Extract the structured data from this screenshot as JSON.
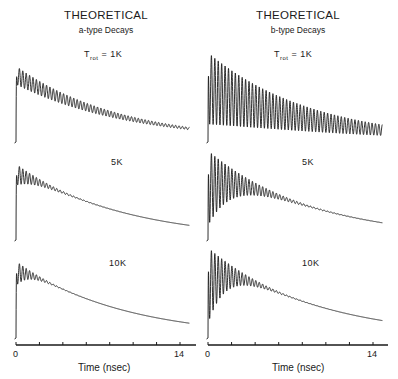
{
  "columns": [
    {
      "title": "THEORETICAL",
      "subtitle": "a-type Decays",
      "x_axis": {
        "label": "Time (nsec)",
        "tick_start": "0",
        "tick_end": "14"
      }
    },
    {
      "title": "THEORETICAL",
      "subtitle": "b-type Decays",
      "x_axis": {
        "label": "Time (nsec)",
        "tick_start": "0",
        "tick_end": "14"
      }
    }
  ],
  "panel_labels": {
    "row1": {
      "prefix": "T",
      "sub": "rot",
      "suffix": " = 1K"
    },
    "row2": "5K",
    "row3": "10K"
  },
  "chart_data": [
    {
      "type": "line",
      "title": "THEORETICAL a-type Decays",
      "xlabel": "Time (nsec)",
      "ylabel": "",
      "xlim": [
        0,
        14.5
      ],
      "x_ticks": [
        0,
        2,
        4,
        6,
        8,
        10,
        12,
        14
      ],
      "x_tick_labels": [
        "0",
        "14"
      ],
      "grid": false,
      "series": [
        {
          "name": "T_rot = 1K",
          "decay_tau_ns": 9.0,
          "beat_period_ns": 0.29,
          "modulation_depth": 0.12,
          "modulation_damping_ns": 40,
          "peak": 1.0
        },
        {
          "name": "5K",
          "decay_tau_ns": 9.0,
          "beat_period_ns": 0.29,
          "modulation_depth": 0.14,
          "modulation_damping_ns": 2.2,
          "peak": 1.0
        },
        {
          "name": "10K",
          "decay_tau_ns": 9.0,
          "beat_period_ns": 0.29,
          "modulation_depth": 0.16,
          "modulation_damping_ns": 1.3,
          "peak": 1.0
        }
      ]
    },
    {
      "type": "line",
      "title": "THEORETICAL b-type Decays",
      "xlabel": "Time (nsec)",
      "ylabel": "",
      "xlim": [
        0,
        14.5
      ],
      "x_ticks": [
        0,
        2,
        4,
        6,
        8,
        10,
        12,
        14
      ],
      "x_tick_labels": [
        "0",
        "14"
      ],
      "grid": false,
      "series": [
        {
          "name": "T_rot = 1K",
          "decay_tau_ns": 9.0,
          "beat_period_ns": 0.29,
          "modulation_depth": 0.4,
          "modulation_damping_ns": 60,
          "peak": 1.0
        },
        {
          "name": "5K",
          "decay_tau_ns": 9.0,
          "beat_period_ns": 0.29,
          "modulation_depth": 0.42,
          "modulation_damping_ns": 3.0,
          "peak": 1.0
        },
        {
          "name": "10K",
          "decay_tau_ns": 9.0,
          "beat_period_ns": 0.29,
          "modulation_depth": 0.42,
          "modulation_damping_ns": 2.0,
          "peak": 1.0
        }
      ]
    }
  ],
  "colors": {
    "ink": "#1a1a1a",
    "background": "#ffffff"
  }
}
